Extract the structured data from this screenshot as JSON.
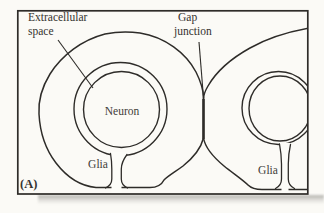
{
  "figure": {
    "panel_label": "(A)",
    "annotations": {
      "extracellular_label_line1": "Extracellular",
      "extracellular_label_line2": "space",
      "gap_junction_label_line1": "Gap",
      "gap_junction_label_line2": "junction"
    },
    "cell_labels": {
      "neuron": "Neuron",
      "glia_left": "Glia",
      "glia_right": "Glia"
    },
    "colors": {
      "glia_fill": "#b8bbb6",
      "neuron_fill": "#d6d8d2",
      "extracellular_space_fill": "#fcfcf8",
      "outline": "#2e2c29",
      "label_text": "#35332f",
      "page_background": "#fbfaf6"
    }
  }
}
